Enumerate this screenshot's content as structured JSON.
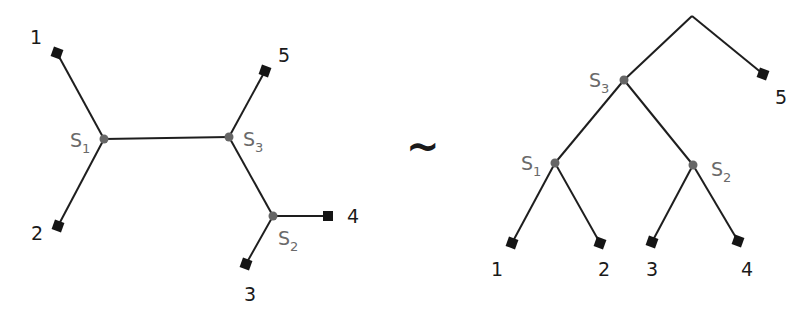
{
  "diagram": {
    "relation_symbol": "~",
    "left_tree": {
      "type": "unrooted",
      "leaves": [
        {
          "label": "1",
          "x": 57,
          "y": 53,
          "lx": 30,
          "ly": 44
        },
        {
          "label": "2",
          "x": 58,
          "y": 226,
          "lx": 31,
          "ly": 240
        },
        {
          "label": "3",
          "x": 246,
          "y": 264,
          "lx": 244,
          "ly": 301
        },
        {
          "label": "4",
          "x": 328,
          "y": 216,
          "lx": 347,
          "ly": 223
        },
        {
          "label": "5",
          "x": 265,
          "y": 71,
          "lx": 278,
          "ly": 62
        }
      ],
      "internal_nodes": [
        {
          "name": "S",
          "sub": "1",
          "x": 104,
          "y": 139,
          "lx": 72,
          "ly": 147
        },
        {
          "name": "S",
          "sub": "3",
          "x": 229,
          "y": 137,
          "lx": 244,
          "ly": 147
        },
        {
          "name": "S",
          "sub": "2",
          "x": 273,
          "y": 216,
          "lx": 278,
          "ly": 247
        }
      ]
    },
    "right_tree": {
      "type": "rooted",
      "root": {
        "x": 692,
        "y": 16
      },
      "leaves": [
        {
          "label": "1",
          "x": 512,
          "y": 243,
          "lx": 491,
          "ly": 276
        },
        {
          "label": "2",
          "x": 600,
          "y": 243,
          "lx": 598,
          "ly": 276
        },
        {
          "label": "3",
          "x": 652,
          "y": 242,
          "lx": 646,
          "ly": 276
        },
        {
          "label": "4",
          "x": 738,
          "y": 241,
          "lx": 741,
          "ly": 276
        },
        {
          "label": "5",
          "x": 763,
          "y": 74,
          "lx": 775,
          "ly": 104
        }
      ],
      "internal_nodes": [
        {
          "name": "S",
          "sub": "3",
          "x": 624,
          "y": 80,
          "lx": 589,
          "ly": 88
        },
        {
          "name": "S",
          "sub": "1",
          "x": 555,
          "y": 163,
          "lx": 523,
          "ly": 171
        },
        {
          "name": "S",
          "sub": "2",
          "x": 693,
          "y": 165,
          "lx": 711,
          "ly": 177
        }
      ]
    }
  }
}
